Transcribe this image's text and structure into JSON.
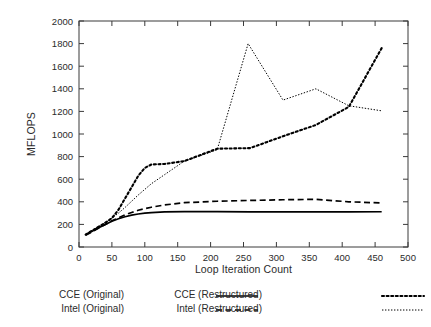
{
  "chart_data": {
    "type": "line",
    "title": "",
    "xlabel": "Loop Iteration Count",
    "ylabel": "MFLOPS",
    "xlim": [
      0,
      500
    ],
    "ylim": [
      0,
      2000
    ],
    "xticks": [
      0,
      50,
      100,
      150,
      200,
      250,
      300,
      350,
      400,
      450,
      500
    ],
    "yticks": [
      0,
      200,
      400,
      600,
      800,
      1000,
      1200,
      1400,
      1600,
      1800,
      2000
    ],
    "grid": false,
    "legend_position": "bottom",
    "series": [
      {
        "name": "CCE (Original)",
        "style": "solid",
        "color": "#000000",
        "x": [
          10,
          20,
          30,
          40,
          50,
          60,
          70,
          80,
          90,
          100,
          110,
          130,
          160,
          210,
          260,
          310,
          360,
          410,
          460
        ],
        "y": [
          108,
          140,
          170,
          200,
          228,
          250,
          268,
          282,
          292,
          300,
          305,
          310,
          313,
          313,
          311,
          310,
          310,
          311,
          312
        ]
      },
      {
        "name": "Intel (Original)",
        "style": "dashed",
        "color": "#000000",
        "x": [
          10,
          20,
          30,
          40,
          50,
          60,
          70,
          80,
          90,
          100,
          110,
          130,
          160,
          210,
          260,
          310,
          360,
          410,
          460
        ],
        "y": [
          105,
          135,
          168,
          200,
          232,
          258,
          285,
          305,
          325,
          340,
          352,
          372,
          392,
          405,
          412,
          418,
          422,
          400,
          390
        ]
      },
      {
        "name": "CCE (Restructured)",
        "style": "dotted-bold",
        "color": "#000000",
        "x": [
          10,
          20,
          30,
          40,
          50,
          60,
          70,
          80,
          90,
          100,
          110,
          130,
          160,
          210,
          260,
          310,
          360,
          410,
          460
        ],
        "y": [
          110,
          145,
          180,
          215,
          255,
          330,
          430,
          530,
          630,
          700,
          730,
          735,
          760,
          870,
          875,
          980,
          1080,
          1240,
          1760
        ]
      },
      {
        "name": "Intel (Restructured)",
        "style": "dotted-fine",
        "color": "#000000",
        "x": [
          10,
          20,
          30,
          40,
          50,
          60,
          70,
          80,
          90,
          100,
          110,
          130,
          160,
          210,
          257,
          310,
          360,
          410,
          460
        ],
        "y": [
          112,
          148,
          182,
          218,
          255,
          300,
          350,
          405,
          460,
          510,
          560,
          640,
          760,
          860,
          1800,
          1300,
          1400,
          1250,
          1205
        ]
      }
    ]
  },
  "legend": {
    "entries": [
      {
        "label": "CCE (Original)",
        "style": "solid"
      },
      {
        "label": "Intel (Original)",
        "style": "dashed"
      },
      {
        "label": "CCE (Restructured)",
        "style": "dotted-bold"
      },
      {
        "label": "Intel (Restructured)",
        "style": "dotted-fine"
      }
    ]
  },
  "colors": {
    "ink": "#000000",
    "axis": "#3a3a3a",
    "background": "#ffffff"
  }
}
